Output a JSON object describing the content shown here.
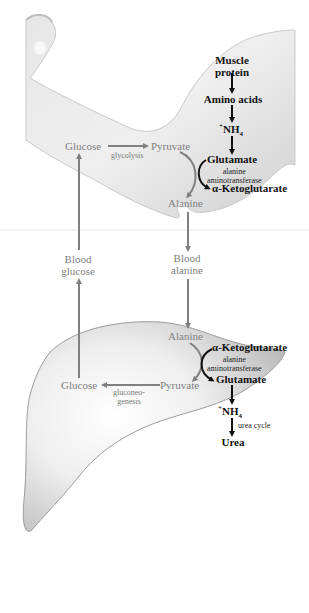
{
  "diagram": {
    "colors": {
      "muscle_pathway": "#111111",
      "cycle_pathway": "#808080",
      "tissue": "#d9d9d9"
    },
    "muscle": {
      "muscle_protein": "Muscle protein",
      "muscle_protein_line1": "Muscle",
      "muscle_protein_line2": "protein",
      "amino_acids": "Amino acids",
      "ammonium_charge": "+",
      "ammonium_base": "NH",
      "ammonium_sub": "4",
      "glutamate": "Glutamate",
      "enzyme_line1": "alanine",
      "enzyme_line2": "aminotransferase",
      "alpha_ketoglutarate": "α-Ketoglutarate",
      "glucose": "Glucose",
      "pyruvate": "Pyruvate",
      "glycolysis": "glycolysis",
      "alanine": "Alanine"
    },
    "blood": {
      "glucose_line1": "Blood",
      "glucose_line2": "glucose",
      "alanine_line1": "Blood",
      "alanine_line2": "alanine"
    },
    "liver": {
      "alanine": "Alanine",
      "alpha_ketoglutarate": "α-Ketoglutarate",
      "enzyme_line1": "alanine",
      "enzyme_line2": "aminotransferase",
      "glutamate": "Glutamate",
      "pyruvate": "Pyruvate",
      "glucose": "Glucose",
      "gluconeogenesis_line1": "gluconeo-",
      "gluconeogenesis_line2": "genesis",
      "ammonium_charge": "+",
      "ammonium_base": "NH",
      "ammonium_sub": "4",
      "urea_cycle": "urea cycle",
      "urea": "Urea"
    }
  }
}
